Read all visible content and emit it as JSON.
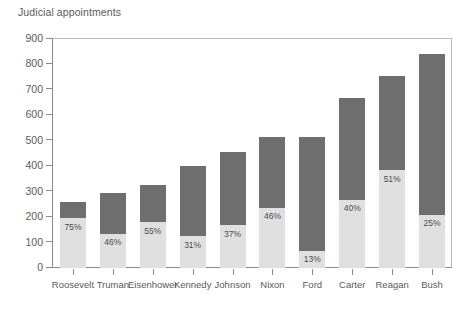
{
  "chart_data": {
    "type": "bar",
    "title": "Judicial appointments",
    "subtitle": "",
    "xlabel": "",
    "ylabel": "",
    "ylim": [
      0,
      900
    ],
    "ytick_step": 100,
    "yticks": [
      0,
      100,
      200,
      300,
      400,
      500,
      600,
      700,
      800,
      900
    ],
    "ytick_labels": [
      "0",
      "100",
      "200",
      "300",
      "400",
      "500",
      "600",
      "700",
      "800",
      "900"
    ],
    "grid": false,
    "legend": "none",
    "stacked": true,
    "categories": [
      "Roosevelt",
      "Truman",
      "Eisenhower",
      "Kennedy",
      "Johnson",
      "Nixon",
      "Ford",
      "Carter",
      "Reagan",
      "Bush"
    ],
    "values": [
      260,
      293,
      325,
      400,
      455,
      515,
      515,
      670,
      755,
      840
    ],
    "percent_labels": [
      "75%",
      "46%",
      "55%",
      "31%",
      "37%",
      "46%",
      "13%",
      "40%",
      "51%",
      "25%"
    ],
    "percents": [
      75,
      46,
      55,
      31,
      37,
      46,
      13,
      40,
      51,
      25
    ],
    "series": [
      {
        "name": "lower-segment",
        "color": "#e0e0e0",
        "values": [
          195,
          135,
          179,
          124,
          168,
          237,
          67,
          268,
          385,
          210
        ]
      },
      {
        "name": "upper-segment",
        "color": "#6e6e6e",
        "values": [
          65,
          158,
          146,
          276,
          287,
          278,
          448,
          402,
          370,
          630
        ]
      }
    ],
    "colors": {
      "bar_dark": "#6e6e6e",
      "bar_light": "#e0e0e0",
      "axis": "#8b8b8b",
      "text": "#5a5a5a",
      "background": "#ffffff"
    }
  }
}
